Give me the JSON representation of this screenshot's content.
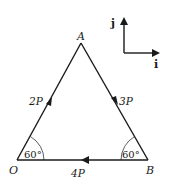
{
  "diagram": {
    "type": "force-triangle",
    "vertices": {
      "A": {
        "label": "A",
        "x": 81,
        "y": 43
      },
      "O": {
        "label": "O",
        "x": 17,
        "y": 160
      },
      "B": {
        "label": "B",
        "x": 148,
        "y": 160
      }
    },
    "forces": [
      {
        "side": "OA",
        "label": "2P",
        "direction": "O to A"
      },
      {
        "side": "AB",
        "label": "3P",
        "direction": "A to B"
      },
      {
        "side": "BO",
        "label": "4P",
        "direction": "B to O"
      }
    ],
    "angles": [
      {
        "vertex": "O",
        "label": "60°"
      },
      {
        "vertex": "B",
        "label": "60°"
      }
    ],
    "unit_vectors": {
      "i": {
        "label": "i",
        "direction": "right"
      },
      "j": {
        "label": "j",
        "direction": "up"
      }
    },
    "colors": {
      "line": "#1a1a1a",
      "background": "#ffffff"
    }
  }
}
